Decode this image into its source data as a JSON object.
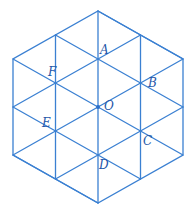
{
  "diagram": {
    "type": "regular hexagon subdivided into equilateral triangles",
    "line_color": "#3b80d2",
    "label_color": "#2456a8",
    "center": {
      "name": "O",
      "x": 98,
      "y": 107
    },
    "points": {
      "O": {
        "label": "O",
        "x": 98,
        "y": 107,
        "label_dx": 5,
        "label_dy": 3
      },
      "A": {
        "label": "A",
        "x": 98,
        "y": 59,
        "label_dx": 2,
        "label_dy": -5
      },
      "B": {
        "label": "B",
        "x": 140,
        "y": 83,
        "label_dx": 8,
        "label_dy": 4
      },
      "C": {
        "label": "C",
        "x": 140,
        "y": 131,
        "label_dx": 3,
        "label_dy": 14
      },
      "D": {
        "label": "D",
        "x": 98,
        "y": 155,
        "label_dx": 2,
        "label_dy": 14
      },
      "E": {
        "label": "E",
        "x": 56,
        "y": 131,
        "label_dx": -13,
        "label_dy": -3
      },
      "F": {
        "label": "F",
        "x": 56,
        "y": 83,
        "label_dx": -7,
        "label_dy": -10
      }
    },
    "labels": [
      "A",
      "B",
      "C",
      "D",
      "E",
      "F",
      "O"
    ]
  }
}
